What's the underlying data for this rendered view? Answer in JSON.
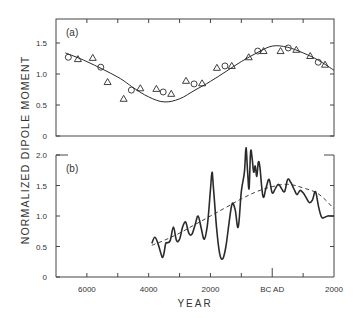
{
  "figure": {
    "ylabel": "NORMALIZED DIPOLE MOMENT",
    "xlabel": "YEAR",
    "x_ticks": [
      {
        "year": -6000,
        "label": "6000"
      },
      {
        "year": -5000,
        "label": ""
      },
      {
        "year": -4000,
        "label": "4000"
      },
      {
        "year": -3000,
        "label": ""
      },
      {
        "year": -2000,
        "label": "2000"
      },
      {
        "year": -1000,
        "label": ""
      },
      {
        "year": 0,
        "label": "BC  AD"
      },
      {
        "year": 1000,
        "label": ""
      },
      {
        "year": 2000,
        "label": "2000"
      }
    ],
    "panel_a_label": "(a)",
    "panel_b_label": "(b)",
    "panel_a_yticks": [
      "0",
      "0.5",
      "1.0",
      "1.5"
    ],
    "panel_b_yticks": [
      "0",
      "0.5",
      "1.0",
      "1.5",
      "2.0"
    ],
    "line_color": "#2a2a2a"
  },
  "chart_data": [
    {
      "type": "scatter",
      "title": "(a)",
      "xlabel": "YEAR",
      "ylabel": "NORMALIZED DIPOLE MOMENT",
      "xlim": [
        -7000,
        2000
      ],
      "ylim": [
        0,
        1.9
      ],
      "grid": false,
      "series": [
        {
          "name": "circles",
          "marker": "circle",
          "x": [
            -6600,
            -5550,
            -4560,
            -3530,
            -2530,
            -1530,
            -470,
            520,
            1490
          ],
          "y": [
            1.27,
            1.11,
            0.74,
            0.71,
            0.84,
            1.13,
            1.37,
            1.42,
            1.19
          ]
        },
        {
          "name": "triangles",
          "marker": "triangle",
          "x": [
            -6290,
            -5810,
            -5330,
            -4810,
            -4270,
            -3750,
            -3270,
            -2790,
            -2270,
            -1790,
            -1310,
            -760,
            -280,
            270,
            780,
            1230,
            1710
          ],
          "y": [
            1.24,
            1.26,
            0.87,
            0.6,
            0.77,
            0.76,
            0.68,
            0.89,
            0.85,
            1.1,
            1.13,
            1.27,
            1.37,
            1.37,
            1.39,
            1.29,
            1.15
          ]
        },
        {
          "name": "fitted sinusoid",
          "marker": "line",
          "x": [
            -6700,
            -6000,
            -5000,
            -4500,
            -4000,
            -3500,
            -3000,
            -2500,
            -2000,
            -1500,
            -1000,
            -500,
            0,
            500,
            1000,
            1500,
            2000
          ],
          "y": [
            1.34,
            1.2,
            0.95,
            0.78,
            0.63,
            0.55,
            0.6,
            0.74,
            0.88,
            1.04,
            1.2,
            1.34,
            1.45,
            1.43,
            1.34,
            1.22,
            1.06
          ]
        }
      ]
    },
    {
      "type": "line",
      "title": "(b)",
      "xlabel": "YEAR",
      "ylabel": "NORMALIZED DIPOLE MOMENT",
      "xlim": [
        -7000,
        2000
      ],
      "ylim": [
        0,
        2.0
      ],
      "grid": false,
      "series": [
        {
          "name": "dipole moment (solid)",
          "style": "solid",
          "x": [
            -3900,
            -3800,
            -3700,
            -3600,
            -3550,
            -3500,
            -3450,
            -3400,
            -3300,
            -3200,
            -3100,
            -3000,
            -2900,
            -2800,
            -2700,
            -2600,
            -2500,
            -2400,
            -2300,
            -2200,
            -2100,
            -2000,
            -1950,
            -1900,
            -1800,
            -1700,
            -1600,
            -1500,
            -1400,
            -1300,
            -1200,
            -1100,
            -1000,
            -900,
            -850,
            -800,
            -750,
            -700,
            -650,
            -600,
            -550,
            -500,
            -450,
            -400,
            -300,
            -200,
            -100,
            0,
            100,
            200,
            300,
            400,
            500,
            600,
            700,
            800,
            900,
            1000,
            1100,
            1200,
            1300,
            1400,
            1500,
            1600,
            1700,
            1800,
            1900,
            2000
          ],
          "y": [
            0.55,
            0.65,
            0.55,
            0.38,
            0.32,
            0.4,
            0.55,
            0.56,
            0.6,
            0.82,
            0.6,
            0.62,
            0.82,
            0.9,
            0.72,
            0.7,
            0.85,
            1.0,
            0.8,
            0.62,
            0.85,
            1.42,
            1.72,
            1.45,
            0.8,
            0.38,
            0.3,
            0.5,
            0.88,
            1.2,
            1.1,
            0.82,
            1.4,
            1.72,
            2.12,
            1.75,
            1.45,
            2.05,
            1.95,
            1.72,
            1.82,
            1.65,
            1.88,
            1.8,
            1.32,
            1.46,
            1.6,
            1.38,
            1.45,
            1.52,
            1.45,
            1.4,
            1.6,
            1.55,
            1.45,
            1.35,
            1.42,
            1.38,
            1.3,
            1.22,
            1.26,
            1.4,
            1.15,
            0.98,
            0.98,
            1.0,
            1.0,
            1.0
          ]
        },
        {
          "name": "smoothed trend (dashed)",
          "style": "dashed",
          "x": [
            -3900,
            -3500,
            -3000,
            -2500,
            -2000,
            -1500,
            -1000,
            -500,
            0,
            500,
            1000,
            1500,
            2000
          ],
          "y": [
            0.52,
            0.6,
            0.72,
            0.86,
            1.0,
            1.14,
            1.28,
            1.4,
            1.48,
            1.52,
            1.46,
            1.36,
            1.12
          ]
        }
      ]
    }
  ]
}
